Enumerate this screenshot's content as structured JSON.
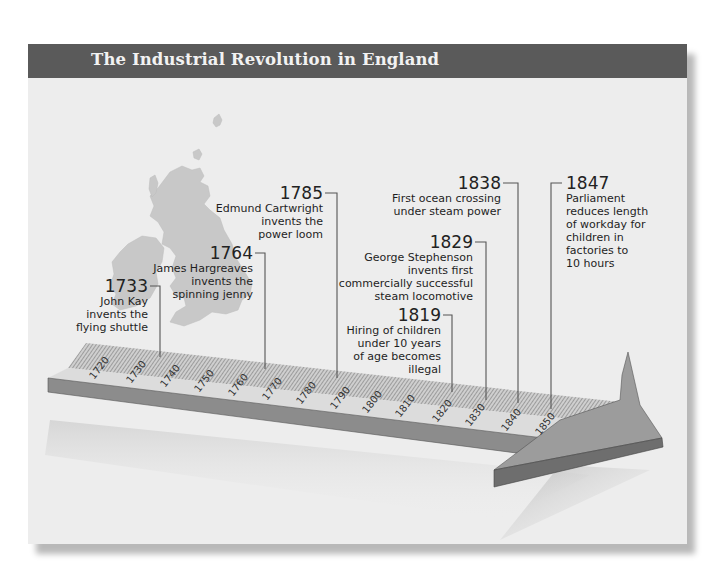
{
  "title": "The Industrial Revolution in England",
  "colors": {
    "header_bg": "#5a5a5a",
    "header_text": "#f2f2f2",
    "panel_bg": "#ededed",
    "map_fill": "#c8c8c8",
    "ruler_top": "#d6d6d6",
    "ruler_side": "#8a8a8a",
    "arrow_fill": "#9a9a9a",
    "leader_line": "#555555"
  },
  "map": {
    "label": "British Isles silhouette"
  },
  "axis": {
    "ticks": [
      "1720",
      "1730",
      "1740",
      "1750",
      "1760",
      "1770",
      "1780",
      "1790",
      "1800",
      "1810",
      "1820",
      "1830",
      "1840",
      "1850"
    ]
  },
  "events": [
    {
      "year": "1733",
      "text_lines": [
        "John Kay",
        "invents the",
        "flying shuttle"
      ]
    },
    {
      "year": "1764",
      "text_lines": [
        "James Hargreaves",
        "invents the",
        "spinning jenny"
      ]
    },
    {
      "year": "1785",
      "text_lines": [
        "Edmund Cartwright",
        "invents the",
        "power loom"
      ]
    },
    {
      "year": "1819",
      "text_lines": [
        "Hiring of children",
        "under 10 years",
        "of age becomes",
        "illegal"
      ]
    },
    {
      "year": "1829",
      "text_lines": [
        "George Stephenson",
        "invents first",
        "commercially successful",
        "steam locomotive"
      ]
    },
    {
      "year": "1838",
      "text_lines": [
        "First ocean crossing",
        "under steam power"
      ]
    },
    {
      "year": "1847",
      "text_lines": [
        "Parliament",
        "reduces length",
        "of workday for",
        "children in",
        "factories to",
        "10 hours"
      ]
    }
  ]
}
